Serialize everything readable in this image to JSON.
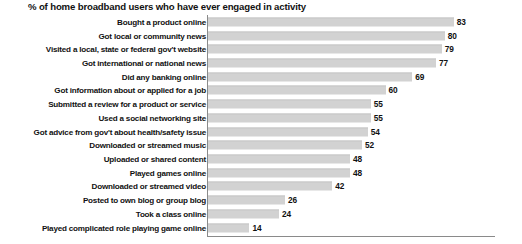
{
  "chart_data": {
    "type": "bar",
    "orientation": "horizontal",
    "title": "% of home broadband users who have ever engaged in activity",
    "xlabel": "",
    "ylabel": "",
    "xlim": [
      0,
      105
    ],
    "grid": false,
    "legend": null,
    "bar_color": "#d2d2d2",
    "axis_color": "#8a8a8a",
    "categories": [
      "Bought a product online",
      "Got local or community news",
      "Visited a local, state or federal gov't website",
      "Got international or national news",
      "Did any banking online",
      "Got information about or applied for a job",
      "Submitted a review for a product or service",
      "Used a social networking site",
      "Got advice from gov't about health/safety issue",
      "Downloaded or streamed music",
      "Uploaded or shared content",
      "Played games online",
      "Downloaded or streamed video",
      "Posted to own blog or group blog",
      "Took a class online",
      "Played complicated role playing game online"
    ],
    "values": [
      83,
      80,
      79,
      77,
      69,
      60,
      55,
      55,
      54,
      52,
      48,
      48,
      42,
      26,
      24,
      14
    ],
    "value_labels": [
      "83",
      "80",
      "79",
      "77",
      "69",
      "60",
      "55",
      "55",
      "54",
      "52",
      "48",
      "48",
      "42",
      "26",
      "24",
      "14"
    ]
  }
}
